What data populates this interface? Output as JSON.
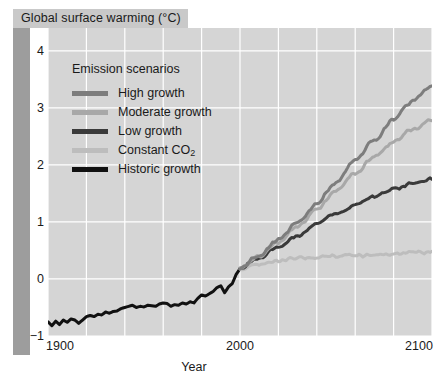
{
  "figure": {
    "title": "Global surface warming (°C)",
    "title_bg": "#c9c9c9",
    "panel_bg": "#d5d5d5",
    "grid_color": "#ffffff",
    "left_bar_color": "#9d9d9d"
  },
  "legend": {
    "title": "Emission scenarios",
    "items": [
      {
        "label": "High growth",
        "color": "#7d7d7d"
      },
      {
        "label": "Moderate growth",
        "color": "#a8a8a8"
      },
      {
        "label": "Low growth",
        "color": "#3a3a3a"
      },
      {
        "label": "Constant CO",
        "sub": "2",
        "color": "#bdbdbd"
      },
      {
        "label": "Historic growth",
        "color": "#111111"
      }
    ]
  },
  "axes": {
    "y_ticks": [
      "4",
      "3",
      "2",
      "1",
      "0",
      "−1"
    ],
    "x_ticks": [
      "1900",
      "2000",
      "2100"
    ],
    "x_label": "Year"
  },
  "chart_data": {
    "type": "line",
    "title": "Global surface warming (°C)",
    "xlabel": "Year",
    "ylabel": "Global surface warming (°C)",
    "xlim": [
      1900,
      2100
    ],
    "ylim": [
      -1,
      4.4
    ],
    "ytick_values": [
      4,
      3,
      2,
      1,
      0,
      -1
    ],
    "xtick_values": [
      1900,
      2000,
      2100
    ],
    "grid": true,
    "grid_x_step": 20,
    "grid_y_step": 1,
    "legend_position": "upper-left-inside",
    "legend_title": "Emission scenarios",
    "series": [
      {
        "name": "Historic growth",
        "color": "#111111",
        "x": [
          1900,
          1902,
          1904,
          1906,
          1908,
          1910,
          1912,
          1914,
          1916,
          1918,
          1920,
          1922,
          1924,
          1926,
          1928,
          1930,
          1932,
          1934,
          1936,
          1938,
          1940,
          1942,
          1944,
          1946,
          1948,
          1950,
          1952,
          1954,
          1956,
          1958,
          1960,
          1962,
          1964,
          1966,
          1968,
          1970,
          1972,
          1974,
          1976,
          1978,
          1980,
          1982,
          1984,
          1986,
          1988,
          1990,
          1992,
          1994,
          1996,
          1998,
          2000
        ],
        "y": [
          -0.75,
          -0.82,
          -0.74,
          -0.8,
          -0.72,
          -0.76,
          -0.7,
          -0.72,
          -0.78,
          -0.72,
          -0.66,
          -0.64,
          -0.66,
          -0.62,
          -0.63,
          -0.58,
          -0.6,
          -0.57,
          -0.56,
          -0.52,
          -0.5,
          -0.48,
          -0.46,
          -0.5,
          -0.48,
          -0.49,
          -0.46,
          -0.47,
          -0.48,
          -0.44,
          -0.42,
          -0.43,
          -0.48,
          -0.45,
          -0.46,
          -0.42,
          -0.44,
          -0.4,
          -0.42,
          -0.34,
          -0.28,
          -0.3,
          -0.26,
          -0.22,
          -0.15,
          -0.12,
          -0.24,
          -0.14,
          -0.08,
          0.08,
          0.18
        ]
      },
      {
        "name": "Constant CO2",
        "color": "#bdbdbd",
        "x": [
          2000,
          2010,
          2020,
          2030,
          2040,
          2050,
          2060,
          2070,
          2080,
          2090,
          2100
        ],
        "y": [
          0.18,
          0.26,
          0.32,
          0.36,
          0.38,
          0.4,
          0.41,
          0.43,
          0.44,
          0.46,
          0.47
        ]
      },
      {
        "name": "Low growth",
        "color": "#3a3a3a",
        "x": [
          2000,
          2010,
          2020,
          2030,
          2040,
          2050,
          2060,
          2070,
          2080,
          2090,
          2100
        ],
        "y": [
          0.18,
          0.36,
          0.56,
          0.76,
          0.96,
          1.14,
          1.3,
          1.45,
          1.58,
          1.68,
          1.75
        ]
      },
      {
        "name": "Moderate growth",
        "color": "#a8a8a8",
        "x": [
          2000,
          2010,
          2020,
          2030,
          2040,
          2050,
          2060,
          2070,
          2080,
          2090,
          2100
        ],
        "y": [
          0.18,
          0.4,
          0.64,
          0.92,
          1.22,
          1.54,
          1.86,
          2.14,
          2.4,
          2.62,
          2.8
        ]
      },
      {
        "name": "High growth",
        "color": "#7d7d7d",
        "x": [
          2000,
          2010,
          2020,
          2030,
          2040,
          2050,
          2060,
          2070,
          2080,
          2090,
          2100
        ],
        "y": [
          0.18,
          0.42,
          0.68,
          0.98,
          1.32,
          1.7,
          2.08,
          2.44,
          2.8,
          3.12,
          3.4
        ]
      }
    ]
  }
}
